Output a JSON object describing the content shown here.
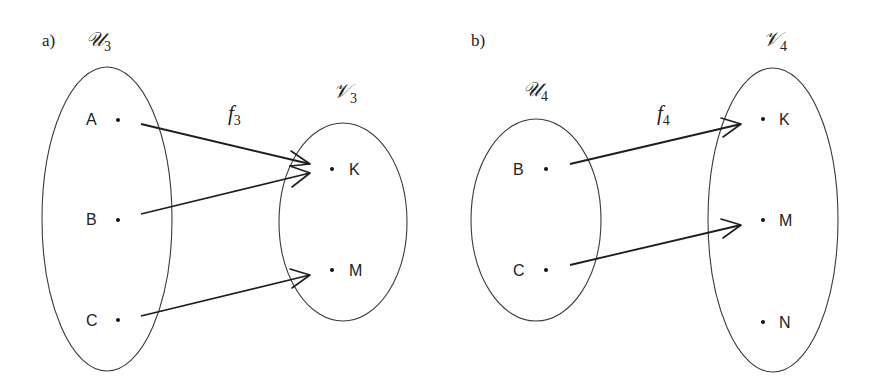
{
  "panels": [
    {
      "id": "a",
      "label": "a)",
      "domain_set": {
        "name": "𝒰",
        "subscript": "3",
        "elements": [
          "A",
          "B",
          "C"
        ]
      },
      "codomain_set": {
        "name": "𝒱",
        "subscript": "3",
        "elements": [
          "K",
          "M"
        ]
      },
      "function": {
        "name": "f",
        "subscript": "3"
      },
      "mappings": [
        {
          "from": "A",
          "to": "K"
        },
        {
          "from": "B",
          "to": "K"
        },
        {
          "from": "C",
          "to": "M"
        }
      ]
    },
    {
      "id": "b",
      "label": "b)",
      "domain_set": {
        "name": "𝒰",
        "subscript": "4",
        "elements": [
          "B",
          "C"
        ]
      },
      "codomain_set": {
        "name": "𝒱",
        "subscript": "4",
        "elements": [
          "K",
          "M",
          "N"
        ]
      },
      "function": {
        "name": "f",
        "subscript": "4"
      },
      "mappings": [
        {
          "from": "B",
          "to": "K"
        },
        {
          "from": "C",
          "to": "M"
        }
      ]
    }
  ],
  "colors": {
    "background": "#ffffff",
    "stroke": "#1e1e1e",
    "text": "#222222"
  }
}
